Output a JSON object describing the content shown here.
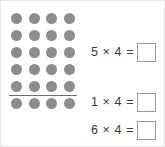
{
  "array": {
    "label": "dot-array",
    "rows": 6,
    "columns": 4,
    "total_dots": 24,
    "dot_color": "#8d8d8d",
    "divider": {
      "label": "group-divider",
      "after_row": 5,
      "color": "#6f6f6f"
    }
  },
  "equations": [
    {
      "text": "5 × 4 =",
      "factor_a": 5,
      "factor_b": 4,
      "answer": ""
    },
    {
      "text": "1 × 4 =",
      "factor_a": 1,
      "factor_b": 4,
      "answer": ""
    },
    {
      "text": "6 × 4 =",
      "factor_a": 6,
      "factor_b": 4,
      "answer": ""
    }
  ]
}
